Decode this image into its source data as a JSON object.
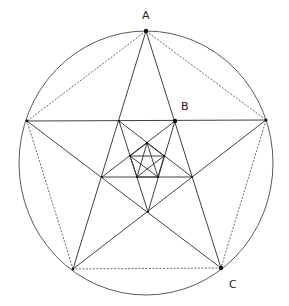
{
  "diagram": {
    "circle": {
      "cx": 146,
      "cy": 163,
      "rx": 127,
      "ry": 132
    },
    "outer_pentagon": {
      "A": [
        146,
        31
      ],
      "R": [
        266,
        120
      ],
      "C": [
        221,
        268
      ],
      "BL": [
        73,
        269
      ],
      "L": [
        27,
        121
      ]
    },
    "inner_pentagon_1": [
      [
        119,
        121
      ],
      [
        175,
        121
      ],
      [
        192,
        177
      ],
      [
        148,
        212
      ],
      [
        102,
        177
      ]
    ],
    "inner_pentagon_2": [
      [
        147,
        143
      ],
      [
        164,
        156
      ],
      [
        158,
        177
      ],
      [
        137,
        177
      ],
      [
        130,
        156
      ]
    ],
    "labels": [
      {
        "id": "A",
        "text": "A",
        "x": 142,
        "y": 19
      },
      {
        "id": "B",
        "text": "B",
        "x": 181,
        "y": 110
      },
      {
        "id": "C",
        "text": "C",
        "x": 229,
        "y": 288
      }
    ],
    "marked_points": [
      {
        "name": "A",
        "x": 146,
        "y": 31,
        "r": 2.2
      },
      {
        "name": "B",
        "x": 175,
        "y": 121,
        "r": 2.2
      },
      {
        "name": "C",
        "x": 221,
        "y": 268,
        "r": 2.2
      },
      {
        "name": "L",
        "x": 27,
        "y": 121,
        "r": 1.4
      },
      {
        "name": "R",
        "x": 266,
        "y": 120,
        "r": 1.6
      },
      {
        "name": "BL",
        "x": 73,
        "y": 269,
        "r": 1.4
      }
    ]
  }
}
